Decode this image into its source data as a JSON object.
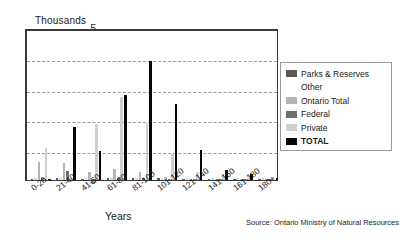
{
  "chart_data": {
    "type": "bar",
    "title": "",
    "units_label": "Thousands",
    "xlabel": "Years",
    "ylabel": "",
    "ylim": [
      0,
      5
    ],
    "yticks": [
      0,
      1,
      2,
      3,
      4,
      5
    ],
    "grid": true,
    "legend_position": "right",
    "categories": [
      "0-20",
      "21-40",
      "41-60",
      "61-80",
      "81-100",
      "101-120",
      "121-140",
      "141-160",
      "161-180",
      "180+"
    ],
    "series": [
      {
        "name": "Parks & Reserves",
        "color": "#585858",
        "values": [
          0.03,
          0.07,
          0.04,
          0.05,
          0.07,
          0.05,
          0.03,
          0.02,
          0.02,
          0.04
        ]
      },
      {
        "name": "Other",
        "color": "#ffffff",
        "values": [
          0.01,
          0.01,
          0.01,
          0.01,
          0.01,
          0.01,
          0.01,
          0.01,
          0.01,
          0.01
        ]
      },
      {
        "name": "Ontario Total",
        "color": "#b4b4b4",
        "values": [
          0.6,
          0.56,
          0.27,
          0.36,
          0.25,
          0.1,
          0.04,
          0.03,
          0.02,
          0.01
        ]
      },
      {
        "name": "Federal",
        "color": "#6e6e6e",
        "values": [
          0.05,
          0.3,
          0.04,
          0.05,
          0.06,
          0.03,
          0.02,
          0.02,
          0.01,
          0.01
        ]
      },
      {
        "name": "Private",
        "color": "#cfcfcf",
        "values": [
          1.05,
          0.04,
          1.85,
          2.72,
          1.88,
          0.86,
          0.28,
          0.19,
          0.07,
          0.02
        ]
      },
      {
        "name": "TOTAL",
        "color": "#050505",
        "values": [
          0.02,
          1.76,
          0.97,
          2.79,
          3.9,
          2.49,
          1.0,
          0.32,
          0.21,
          0.05
        ]
      }
    ],
    "source": "Source: Ontario Ministry of Natural Resources"
  },
  "legend": {
    "entries": [
      {
        "label": "Parks & Reserves"
      },
      {
        "label": "Other"
      },
      {
        "label": "Ontario Total"
      },
      {
        "label": "Federal"
      },
      {
        "label": "Private"
      },
      {
        "label": "TOTAL"
      }
    ]
  }
}
